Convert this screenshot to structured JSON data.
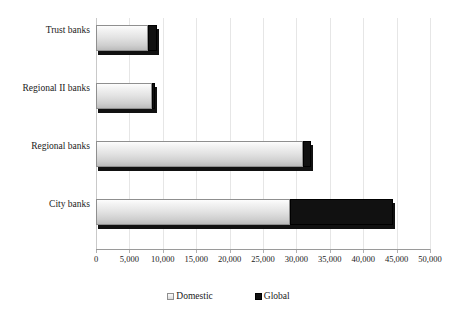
{
  "chart_data": {
    "type": "bar",
    "orientation": "horizontal",
    "stacked": true,
    "title": "",
    "xlabel": "",
    "ylabel": "",
    "xlim": [
      0,
      50000
    ],
    "xticks": [
      0,
      5000,
      10000,
      15000,
      20000,
      25000,
      30000,
      35000,
      40000,
      45000,
      50000
    ],
    "xtick_labels": [
      "0",
      "5,000",
      "10,000",
      "15,000",
      "20,000",
      "25,000",
      "30,000",
      "35,000",
      "40,000",
      "45,000",
      "50,000"
    ],
    "categories": [
      "Trust banks",
      "Regional II banks",
      "Regional banks",
      "City banks"
    ],
    "series": [
      {
        "name": "Domestic",
        "color": "#e3e3e3",
        "values": [
          7800,
          8400,
          31000,
          29000
        ]
      },
      {
        "name": "Global",
        "color": "#111111",
        "values": [
          1300,
          400,
          1200,
          15500
        ]
      }
    ],
    "totals": [
      9100,
      8800,
      32200,
      44500
    ],
    "legend": {
      "position": "bottom",
      "entries": [
        {
          "label": "Domestic",
          "swatch": "light-gray-square"
        },
        {
          "label": "Global",
          "swatch": "black-square"
        }
      ]
    },
    "grid": {
      "vertical": true,
      "horizontal": false,
      "color": "#e6e6e6"
    }
  }
}
